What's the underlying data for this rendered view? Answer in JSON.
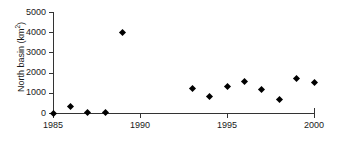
{
  "chart_data": {
    "type": "scatter",
    "title": "",
    "subtitle": "",
    "xlabel": "",
    "ylabel": "North basin (km2)",
    "ylabel_base": "North basin (km",
    "ylabel_sup": "2",
    "ylabel_tail": ")",
    "xlim": [
      1985,
      2000
    ],
    "ylim": [
      0,
      5000
    ],
    "grid": false,
    "legend": null,
    "legend_position": "none",
    "marker": "diamond",
    "marker_color": "#000000",
    "xticks": [
      1985,
      1990,
      1995,
      2000
    ],
    "xtick_labels": [
      "1985",
      "1990",
      "1995",
      "2000"
    ],
    "yticks": [
      0,
      1000,
      2000,
      3000,
      4000,
      5000
    ],
    "ytick_labels": [
      "0",
      "1000",
      "2000",
      "3000",
      "4000",
      "5000"
    ],
    "x": [
      1985,
      1986,
      1987,
      1988,
      1989,
      1993,
      1994,
      1995,
      1996,
      1997,
      1998,
      1999,
      2000
    ],
    "y": [
      0,
      300,
      30,
      30,
      4000,
      1200,
      800,
      1320,
      1550,
      1180,
      650,
      1700,
      1530
    ],
    "points": [
      {
        "x": 1985,
        "y": 0
      },
      {
        "x": 1986,
        "y": 300
      },
      {
        "x": 1987,
        "y": 30
      },
      {
        "x": 1988,
        "y": 30
      },
      {
        "x": 1989,
        "y": 4000
      },
      {
        "x": 1993,
        "y": 1200
      },
      {
        "x": 1994,
        "y": 800
      },
      {
        "x": 1995,
        "y": 1320
      },
      {
        "x": 1996,
        "y": 1550
      },
      {
        "x": 1997,
        "y": 1180
      },
      {
        "x": 1998,
        "y": 650
      },
      {
        "x": 1999,
        "y": 1700
      },
      {
        "x": 2000,
        "y": 1530
      }
    ],
    "axis_color": "#333333",
    "text_color": "#1a1a1a",
    "background": "#ffffff"
  }
}
